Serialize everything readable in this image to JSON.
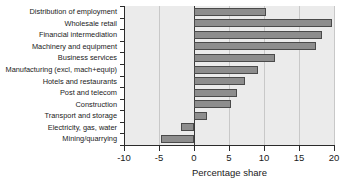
{
  "chart_data": {
    "type": "bar",
    "orientation": "horizontal",
    "title": "",
    "xlabel": "Percentage share",
    "ylabel": "",
    "xlim": [
      -10,
      20
    ],
    "xticks": [
      -10,
      -5,
      0,
      5,
      10,
      15,
      20
    ],
    "xticklabels": [
      "-10",
      "-5",
      "0",
      "5",
      "10",
      "15",
      "20"
    ],
    "grid": true,
    "grid_axis": "x",
    "zero_line": true,
    "legend": null,
    "categories": [
      "Distribution of employment",
      "Wholesale retail",
      "Financial intermediation",
      "Machinery and equipment",
      "Business services",
      "Manufacturing (excl, mach+equip)",
      "Hotels and restaurants",
      "Post and telecom",
      "Construction",
      "Transport and storage",
      "Electricity, gas, water",
      "Mining/quarrying"
    ],
    "values": [
      10.3,
      19.7,
      18.3,
      17.4,
      11.5,
      9.1,
      7.3,
      6.1,
      5.3,
      1.8,
      -1.8,
      -4.7
    ],
    "bar_color": "#8d8d8d",
    "bar_edge_color": "#4a4a4a",
    "plot_background": "#ebebeb"
  }
}
